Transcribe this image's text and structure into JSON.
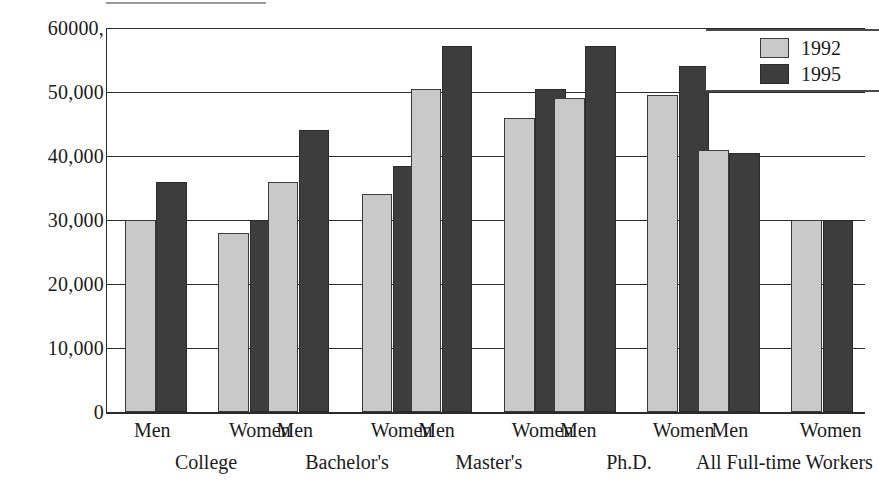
{
  "chart_data": {
    "type": "bar",
    "title": "",
    "xlabel": "",
    "ylabel": "",
    "ylim": [
      0,
      60000
    ],
    "grid": true,
    "legend_position": "top-right",
    "categories": [
      "College – Men",
      "College – Women",
      "Bachelor's – Men",
      "Bachelor's – Women",
      "Master's – Men",
      "Master's – Women",
      "Ph.D. – Men",
      "Ph.D. – Women",
      "All Full-time Workers – Men",
      "All Full-time Workers – Women"
    ],
    "series": [
      {
        "name": "1992",
        "color": "#c9c9c9",
        "values": [
          30000,
          28000,
          36000,
          34000,
          50500,
          46000,
          49000,
          49500,
          41000,
          30000
        ]
      },
      {
        "name": "1995",
        "color": "#3d3d3d",
        "values": [
          36000,
          30000,
          44000,
          38500,
          57200,
          50500,
          57200,
          54000,
          40500,
          30000
        ]
      }
    ],
    "yticks": [
      {
        "value": 60000,
        "label": "60000,"
      },
      {
        "value": 50000,
        "label": "50,000"
      },
      {
        "value": 40000,
        "label": "40,000"
      },
      {
        "value": 30000,
        "label": "30,000"
      },
      {
        "value": 20000,
        "label": "20,000"
      },
      {
        "value": 10000,
        "label": "10,000"
      },
      {
        "value": 0,
        "label": "0"
      }
    ],
    "groups": [
      {
        "label": "College",
        "center_pct": 13.2,
        "subgroups": [
          {
            "label": "Men",
            "center_pct": 6.1
          },
          {
            "label": "Women",
            "center_pct": 20.3
          }
        ]
      },
      {
        "label": "Bachelor's",
        "center_pct": 31.8,
        "subgroups": [
          {
            "label": "Men",
            "center_pct": 24.9
          },
          {
            "label": "Women",
            "center_pct": 39.0
          }
        ]
      },
      {
        "label": "Master's",
        "center_pct": 50.5,
        "subgroups": [
          {
            "label": "Men",
            "center_pct": 43.6
          },
          {
            "label": "Women",
            "center_pct": 57.6
          }
        ]
      },
      {
        "label": "Ph.D.",
        "center_pct": 69.0,
        "subgroups": [
          {
            "label": "Men",
            "center_pct": 62.3
          },
          {
            "label": "Women",
            "center_pct": 76.2
          }
        ]
      },
      {
        "label": "All Full-time Workers",
        "center_pct": 89.5,
        "subgroups": [
          {
            "label": "Men",
            "center_pct": 82.3
          },
          {
            "label": "Women",
            "center_pct": 95.6
          }
        ]
      }
    ],
    "bars": [
      {
        "group": "College",
        "sub": "Men",
        "series": "1992",
        "value": 30000,
        "left_pct": 2.4,
        "width_pct": 4.0
      },
      {
        "group": "College",
        "sub": "Men",
        "series": "1995",
        "value": 36000,
        "left_pct": 6.5,
        "width_pct": 4.0
      },
      {
        "group": "College",
        "sub": "Women",
        "series": "1992",
        "value": 28000,
        "left_pct": 14.7,
        "width_pct": 4.0
      },
      {
        "group": "College",
        "sub": "Women",
        "series": "1995",
        "value": 30000,
        "left_pct": 18.8,
        "width_pct": 4.0
      },
      {
        "group": "Bachelor's",
        "sub": "Men",
        "series": "1992",
        "value": 36000,
        "left_pct": 21.2,
        "width_pct": 4.0
      },
      {
        "group": "Bachelor's",
        "sub": "Men",
        "series": "1995",
        "value": 44000,
        "left_pct": 25.3,
        "width_pct": 4.0
      },
      {
        "group": "Bachelor's",
        "sub": "Women",
        "series": "1992",
        "value": 34000,
        "left_pct": 33.6,
        "width_pct": 4.0
      },
      {
        "group": "Bachelor's",
        "sub": "Women",
        "series": "1995",
        "value": 38500,
        "left_pct": 37.7,
        "width_pct": 4.0
      },
      {
        "group": "Master's",
        "sub": "Men",
        "series": "1992",
        "value": 50500,
        "left_pct": 40.1,
        "width_pct": 4.0
      },
      {
        "group": "Master's",
        "sub": "Men",
        "series": "1995",
        "value": 57200,
        "left_pct": 44.2,
        "width_pct": 4.0
      },
      {
        "group": "Master's",
        "sub": "Women",
        "series": "1992",
        "value": 46000,
        "left_pct": 52.4,
        "width_pct": 4.0
      },
      {
        "group": "Master's",
        "sub": "Women",
        "series": "1995",
        "value": 50500,
        "left_pct": 56.5,
        "width_pct": 4.0
      },
      {
        "group": "Ph.D.",
        "sub": "Men",
        "series": "1992",
        "value": 49000,
        "left_pct": 59.0,
        "width_pct": 4.0
      },
      {
        "group": "Ph.D.",
        "sub": "Men",
        "series": "1995",
        "value": 57200,
        "left_pct": 63.1,
        "width_pct": 4.0
      },
      {
        "group": "Ph.D.",
        "sub": "Women",
        "series": "1992",
        "value": 49500,
        "left_pct": 71.3,
        "width_pct": 4.0
      },
      {
        "group": "Ph.D.",
        "sub": "Women",
        "series": "1995",
        "value": 54000,
        "left_pct": 75.4,
        "width_pct": 4.0
      },
      {
        "group": "All Full-time Workers",
        "sub": "Men",
        "series": "1992",
        "value": 41000,
        "left_pct": 78.0,
        "width_pct": 4.0
      },
      {
        "group": "All Full-time Workers",
        "sub": "Men",
        "series": "1995",
        "value": 40500,
        "left_pct": 82.1,
        "width_pct": 4.0
      },
      {
        "group": "All Full-time Workers",
        "sub": "Women",
        "series": "1992",
        "value": 30000,
        "left_pct": 90.3,
        "width_pct": 4.0
      },
      {
        "group": "All Full-time Workers",
        "sub": "Women",
        "series": "1995",
        "value": 30000,
        "left_pct": 94.4,
        "width_pct": 4.0
      }
    ]
  },
  "legend": {
    "items": [
      {
        "label": "1992",
        "color": "#c9c9c9"
      },
      {
        "label": "1995",
        "color": "#3d3d3d"
      }
    ]
  }
}
